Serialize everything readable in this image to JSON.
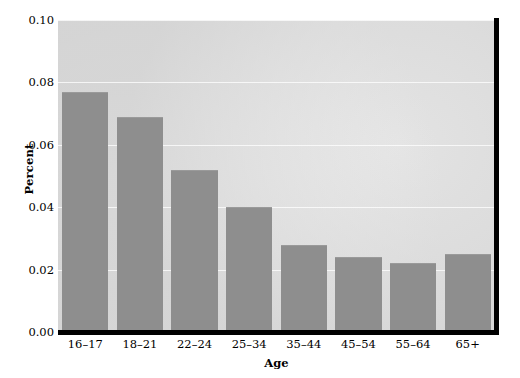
{
  "chart_data": {
    "type": "bar",
    "title": "",
    "subtitle": "",
    "xlabel": "Age",
    "ylabel": "Percent",
    "categories": [
      "16–17",
      "18–21",
      "22–24",
      "25–34",
      "35–44",
      "45–54",
      "55–64",
      "65+"
    ],
    "values": [
      0.077,
      0.069,
      0.052,
      0.04,
      0.028,
      0.024,
      0.022,
      0.025
    ],
    "series": [
      {
        "name": "Percent",
        "values": [
          0.077,
          0.069,
          0.052,
          0.04,
          0.028,
          0.024,
          0.022,
          0.025
        ]
      }
    ],
    "ylim": [
      0.0,
      0.1
    ],
    "yticks": [
      0.0,
      0.02,
      0.04,
      0.06,
      0.08,
      0.1
    ],
    "ytick_labels": [
      "0.00",
      "0.02",
      "0.04",
      "0.06",
      "0.08",
      "0.10"
    ],
    "grid": true,
    "grid_axis": "y",
    "legend": false,
    "legend_position": "none",
    "bar_color": "#8e8e8e",
    "plot_background": "#e8e8e8",
    "axis_color": "#000000",
    "gridline_color": "#ffffff"
  }
}
